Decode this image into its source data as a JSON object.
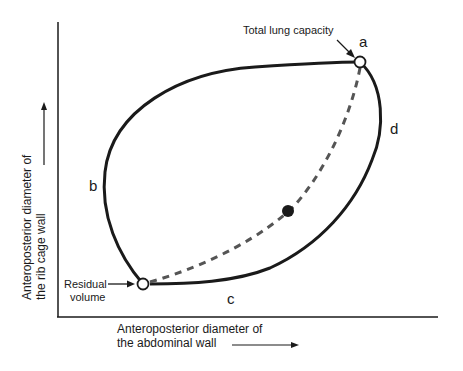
{
  "diagram": {
    "y_axis_label": {
      "line1": "Anteroposterior diameter of",
      "line2": "the rib cage wall"
    },
    "x_axis_label": {
      "line1": "Anteroposterior diameter of",
      "line2": "the abdominal wall"
    },
    "points": {
      "total_lung_capacity": {
        "label": "Total lung capacity",
        "letter": "a"
      },
      "residual_volume": {
        "label_line1": "Residual",
        "label_line2": "volume"
      }
    },
    "curve_letters": {
      "b": "b",
      "c": "c",
      "d": "d"
    },
    "colors": {
      "line": "#1a1a1a",
      "dashed": "#555555",
      "background": "#ffffff"
    }
  }
}
